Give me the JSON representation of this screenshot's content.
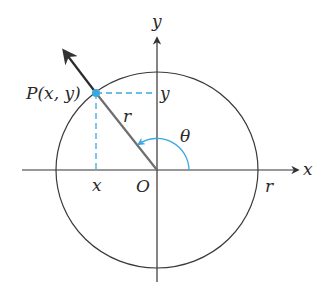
{
  "diagram": {
    "labels": {
      "y_axis": "y",
      "x_axis": "x",
      "point": "P(x, y)",
      "point_y": "y",
      "point_x": "x",
      "radius_segment": "r",
      "angle": "θ",
      "origin": "O",
      "radius_axis": "r"
    },
    "colors": {
      "axis": "#333333",
      "circle": "#3a3a3a",
      "radius": "#6e6e6e",
      "ray": "#2b2b2b",
      "accent": "#3aa8e0"
    }
  }
}
